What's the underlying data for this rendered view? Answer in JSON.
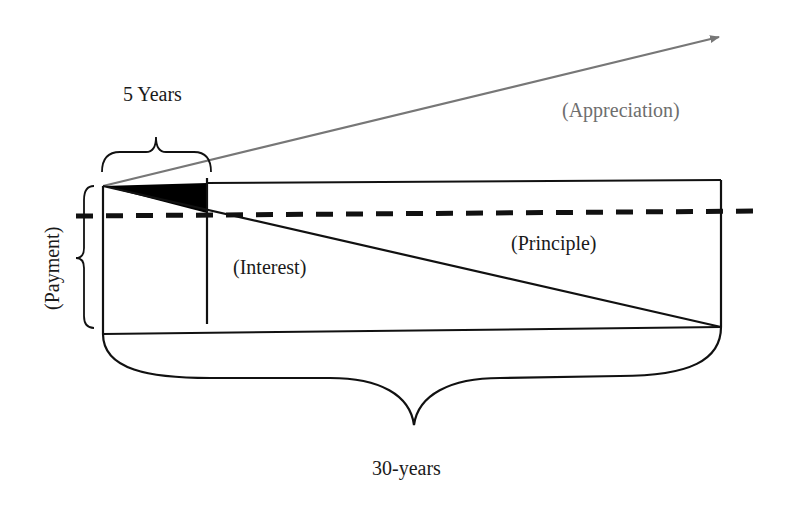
{
  "diagram": {
    "type": "mortgage-amortization-diagram",
    "labels": {
      "five_years": "5 Years",
      "appreciation": "(Appreciation)",
      "payment": "(Payment)",
      "interest": "(Interest)",
      "principle": "(Principle)",
      "thirty_years": "30-years"
    },
    "colors": {
      "line": "#111111",
      "appreciation_arrow": "#777777",
      "appreciation_text": "#6e6e6e",
      "interest_fill": "#000000",
      "background": "#ffffff"
    },
    "elements": [
      {
        "name": "loan-rectangle",
        "description": "Box representing loan payments over 30 years"
      },
      {
        "name": "interest-principal-diagonal",
        "description": "Diagonal splitting interest (below-left) from principle (above-right)"
      },
      {
        "name": "five-year-marker",
        "description": "Vertical line at 5 years"
      },
      {
        "name": "equity-triangle",
        "description": "Filled black triangle — principal paid in first 5 years"
      },
      {
        "name": "payment-dashed-line",
        "description": "Dashed horizontal line at payment level"
      },
      {
        "name": "appreciation-arrow",
        "description": "Gray arrow rising from origin"
      },
      {
        "name": "five-year-brace",
        "description": "Brace spanning first 5 years"
      },
      {
        "name": "payment-brace",
        "description": "Vertical brace spanning payment height"
      },
      {
        "name": "thirty-year-brace",
        "description": "Brace spanning 30-year term"
      }
    ]
  }
}
